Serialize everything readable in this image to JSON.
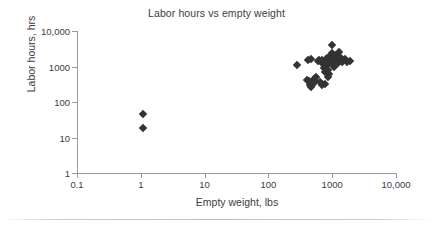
{
  "chart_data": {
    "type": "scatter",
    "title": "Labor hours vs empty weight",
    "xlabel": "Empty weight, lbs",
    "ylabel": "Labor hours, hrs",
    "xscale": "log",
    "yscale": "log",
    "xlim": [
      0.1,
      10000
    ],
    "ylim": [
      1,
      10000
    ],
    "xticklabels": [
      "0.1",
      "1",
      "10",
      "100",
      "1000",
      "10,000"
    ],
    "xtickvalues": [
      0.1,
      1,
      10,
      100,
      1000,
      10000
    ],
    "yticklabels": [
      "1",
      "10",
      "100",
      "1000",
      "10,000"
    ],
    "ytickvalues": [
      1,
      10,
      100,
      1000,
      10000
    ],
    "grid": false,
    "legend": null,
    "marker": "diamond",
    "marker_color": "#333333",
    "marker_size": 6,
    "series": [
      {
        "name": "aircraft",
        "points": [
          [
            1.1,
            47
          ],
          [
            1.1,
            18
          ],
          [
            280,
            1100
          ],
          [
            420,
            1500
          ],
          [
            470,
            1650
          ],
          [
            400,
            420
          ],
          [
            430,
            390
          ],
          [
            450,
            300
          ],
          [
            470,
            270
          ],
          [
            500,
            330
          ],
          [
            520,
            450
          ],
          [
            540,
            380
          ],
          [
            560,
            520
          ],
          [
            600,
            1400
          ],
          [
            620,
            1550
          ],
          [
            650,
            360
          ],
          [
            680,
            330
          ],
          [
            700,
            1500
          ],
          [
            720,
            1200
          ],
          [
            740,
            900
          ],
          [
            760,
            700
          ],
          [
            780,
            950
          ],
          [
            800,
            1300
          ],
          [
            820,
            1700
          ],
          [
            840,
            1100
          ],
          [
            860,
            800
          ],
          [
            880,
            600
          ],
          [
            900,
            1250
          ],
          [
            920,
            1450
          ],
          [
            940,
            2000
          ],
          [
            960,
            1350
          ],
          [
            980,
            4000
          ],
          [
            1000,
            2400
          ],
          [
            1000,
            1600
          ],
          [
            1020,
            1150
          ],
          [
            1050,
            1800
          ],
          [
            1080,
            1000
          ],
          [
            1100,
            1400
          ],
          [
            1150,
            2100
          ],
          [
            1200,
            1500
          ],
          [
            1250,
            1250
          ],
          [
            1300,
            2600
          ],
          [
            1350,
            1700
          ],
          [
            1400,
            1350
          ],
          [
            1500,
            1450
          ],
          [
            1600,
            1600
          ],
          [
            1700,
            1300
          ],
          [
            1900,
            1400
          ],
          [
            860,
            520
          ],
          [
            760,
            330
          ],
          [
            700,
            300
          ]
        ]
      }
    ]
  }
}
